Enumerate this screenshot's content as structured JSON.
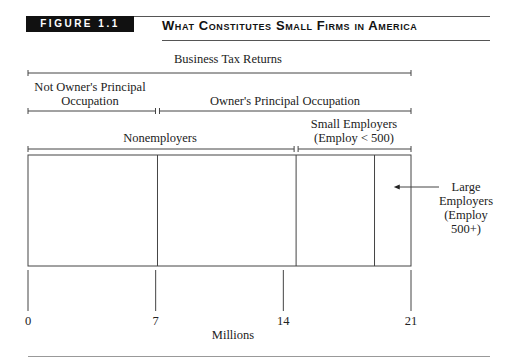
{
  "header": {
    "figure_label": "FIGURE 1.1",
    "title": "What Constitutes Small Firms in America"
  },
  "chart_data": {
    "type": "diagram",
    "title": "What Constitutes Small Firms in America",
    "xlabel": "Millions",
    "xlim": [
      0,
      21
    ],
    "ticks": [
      0,
      7,
      14,
      21
    ],
    "tick_labels": [
      "0",
      "7",
      "14",
      "21"
    ],
    "brackets": [
      {
        "label": "Business Tax Returns",
        "start": 0,
        "end": 21,
        "row": 0
      },
      {
        "label": "Not Owner's Principal Occupation",
        "start": 0,
        "end": 7.1,
        "row": 1
      },
      {
        "label": "Owner's Principal Occupation",
        "start": 7.1,
        "end": 21,
        "row": 1
      },
      {
        "label": "Nonemployers",
        "start": 0,
        "end": 14.7,
        "row": 2
      },
      {
        "label": "Small Employers (Employ < 500)",
        "start": 14.7,
        "end": 21,
        "row": 2
      }
    ],
    "segments": [
      {
        "name": "Not owner's principal occupation (nonemployers)",
        "start": 0,
        "end": 7.1
      },
      {
        "name": "Owner's principal occupation nonemployers",
        "start": 7.1,
        "end": 14.7
      },
      {
        "name": "Small employers",
        "start": 14.7,
        "end": 19.0
      },
      {
        "name": "Large employers",
        "start": 19.0,
        "end": 21
      }
    ],
    "annotation": {
      "label": "Large Employers (Employ 500+)",
      "points_to": "Large employers"
    }
  },
  "labels": {
    "business_tax_returns": "Business Tax Returns",
    "not_owner_line1": "Not Owner's Principal",
    "not_owner_line2": "Occupation",
    "owner_principal": "Owner's Principal Occupation",
    "nonemployers": "Nonemployers",
    "small_line1": "Small Employers",
    "small_line2": "(Employ < 500)",
    "large_line1": "Large",
    "large_line2": "Employers",
    "large_line3": "(Employ",
    "large_line4": "500+)",
    "xlabel": "Millions"
  }
}
